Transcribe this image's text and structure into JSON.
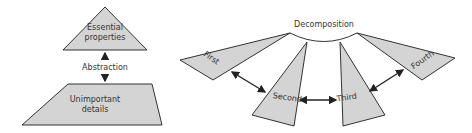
{
  "abstraction": {
    "top_label_line1": "Essential",
    "top_label_line2": "properties",
    "middle_label": "Abstraction",
    "bottom_label_line1": "Unimportant",
    "bottom_label_line2": "details"
  },
  "decomposition": {
    "title": "Decomposition",
    "parts": [
      "First",
      "Second",
      "Third",
      "Fourth"
    ]
  }
}
